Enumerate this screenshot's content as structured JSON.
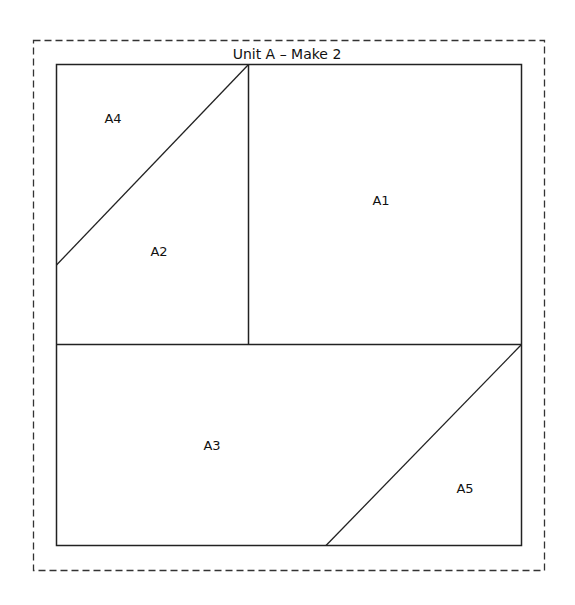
{
  "diagram": {
    "title": "Unit A – Make 2",
    "colors": {
      "line": "#222222",
      "dashed_border": "#333333",
      "background": "#ffffff"
    },
    "pieces": [
      {
        "id": "A1",
        "label": "A1"
      },
      {
        "id": "A2",
        "label": "A2"
      },
      {
        "id": "A3",
        "label": "A3"
      },
      {
        "id": "A4",
        "label": "A4"
      },
      {
        "id": "A5",
        "label": "A5"
      }
    ]
  }
}
